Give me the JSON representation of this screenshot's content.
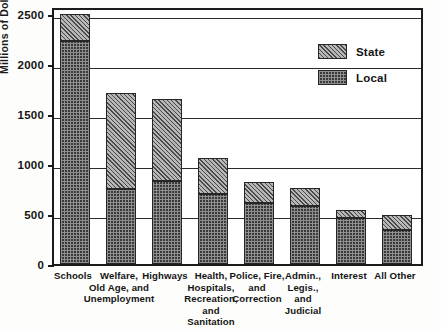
{
  "chart_data": {
    "type": "bar",
    "subtype": "stacked",
    "title": "",
    "xlabel": "",
    "ylabel": "Millions of Dollars",
    "ylim": [
      0,
      2600
    ],
    "yticks": [
      0,
      500,
      1000,
      1500,
      2000,
      2500
    ],
    "ytick_labels": [
      "0",
      "500",
      "1000",
      "1500",
      "2000",
      "2500"
    ],
    "grid": true,
    "grid_axis": "y",
    "legend_position": "upper right",
    "categories": [
      "Schools",
      "Welfare, Old Age, and Unemployment",
      "Highways",
      "Health, Hospitals, Recreation, and Sanitation",
      "Police, Fire, and Correction",
      "Admin., Legis., and Judicial",
      "Interest",
      "All Other"
    ],
    "category_label_lines": [
      [
        "Schools"
      ],
      [
        "Welfare,",
        "Old Age, and",
        "Unemployment"
      ],
      [
        "Highways"
      ],
      [
        "Health,",
        "Hospitals,",
        "Recreation,",
        "and",
        "Sanitation"
      ],
      [
        "Police, Fire,",
        "and",
        "Correction"
      ],
      [
        "Admin.,",
        "Legis.,",
        "and",
        "Judicial"
      ],
      [
        "Interest"
      ],
      [
        "All Other"
      ]
    ],
    "series": [
      {
        "name": "Local",
        "pattern": "dotted-dark",
        "color": "#3a3a3a",
        "values": [
          2230,
          750,
          830,
          700,
          610,
          580,
          460,
          340
        ]
      },
      {
        "name": "State",
        "pattern": "diagonal-hatch-light",
        "color": "#b7b7b7",
        "values": [
          270,
          960,
          820,
          360,
          210,
          180,
          80,
          150
        ]
      }
    ],
    "totals": [
      2500,
      1710,
      1650,
      1060,
      820,
      760,
      540,
      490
    ]
  },
  "legend": {
    "items": [
      {
        "label": "State",
        "pattern": "diagonal-hatch-light"
      },
      {
        "label": "Local",
        "pattern": "dotted-dark"
      }
    ]
  },
  "axes": {
    "y_title": "Millions of Dollars",
    "y_ticks": [
      "2500",
      "2000",
      "1500",
      "1000",
      "500",
      "0"
    ]
  }
}
